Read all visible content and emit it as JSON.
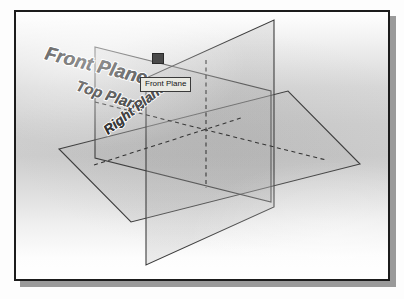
{
  "viewport": {
    "name": "cad-graphics-viewport",
    "background_top_color": "#ffffff",
    "background_mid_color": "#cdcdcd",
    "border_color": "#1c1c1c",
    "shadow_color": "#9a9a9a"
  },
  "planes": [
    {
      "id": "front-plane",
      "label": "Front Plane",
      "orientation": "vertical-left-facing",
      "edge_color": "#3b3b3b",
      "fill_color": "rgba(150,150,150,0.16)"
    },
    {
      "id": "top-plane",
      "label": "Top Plane",
      "orientation": "horizontal",
      "edge_color": "#3b3b3b",
      "fill_color": "rgba(150,150,150,0.16)"
    },
    {
      "id": "right-plane",
      "label": "Right Plane",
      "orientation": "vertical-right-facing",
      "edge_color": "#3b3b3b",
      "fill_color": "rgba(150,150,150,0.16)"
    }
  ],
  "tooltip": {
    "text": "Front Plane",
    "background_color": "#e9e9e2",
    "border_color": "#3a3a3a",
    "text_color": "#141414"
  },
  "cursor_handle": {
    "name": "selection-handle",
    "color": "#4a4a4a"
  },
  "labels": {
    "front": "Front Plane",
    "top": "Top Plane",
    "right": "Right Plane"
  }
}
